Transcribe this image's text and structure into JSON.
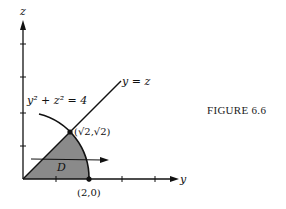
{
  "figure": {
    "caption": "FIGURE 6.6",
    "axes": {
      "horizontal_label": "y",
      "vertical_label": "z"
    },
    "curves": {
      "circle_label": "y² + z² = 4",
      "line_label": "y = z"
    },
    "points": {
      "intersection": "(√2,√2)",
      "axis_point": "(2,0)"
    },
    "region_label": "D",
    "colors": {
      "region_fill": "#8a8a8a",
      "ink": "#111111"
    }
  }
}
